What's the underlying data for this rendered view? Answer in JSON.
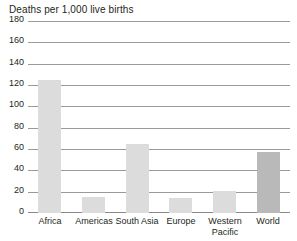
{
  "chart_data": {
    "type": "bar",
    "title": "Deaths per 1,000 live births",
    "xlabel": "",
    "ylabel": "",
    "categories": [
      "Africa",
      "Americas",
      "South Asia",
      "Europe",
      "Western Pacific",
      "World"
    ],
    "values": [
      125,
      15,
      65,
      14,
      21,
      57
    ],
    "ylim": [
      0,
      180
    ],
    "yticks": [
      0,
      20,
      40,
      60,
      80,
      100,
      120,
      140,
      160,
      180
    ],
    "ytick_labels": [
      "0",
      "20",
      "40",
      "60",
      "80",
      "100",
      "120",
      "140",
      "160",
      "180"
    ],
    "grid": true,
    "legend": "none",
    "colors": {
      "bar": "#dcdcdc",
      "bar_highlight": "#b9b9b9",
      "gridline": "#9a9a9a",
      "axis": "#8a8a8a",
      "text": "#231f20",
      "background": "#ffffff"
    },
    "highlight_category": "World"
  }
}
